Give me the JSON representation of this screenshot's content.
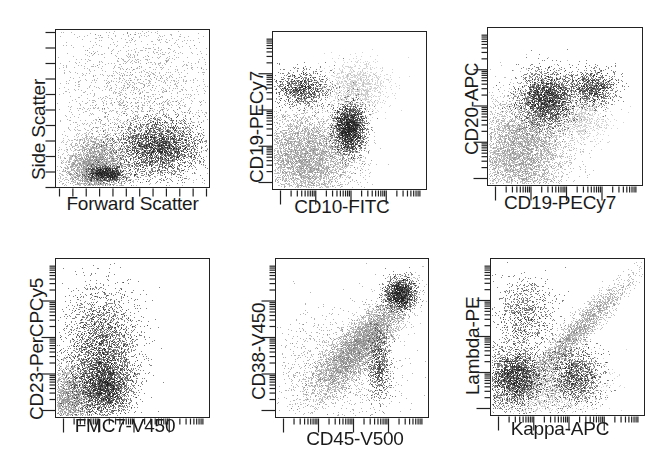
{
  "figure": {
    "colors": {
      "dark_population": "#1e1e1e",
      "gray_population": "#8a8a8a",
      "light_population": "#b8b8b8",
      "axis": "#222222"
    }
  },
  "chart_data": [
    {
      "type": "scatter",
      "title": "",
      "xlabel": "Forward Scatter",
      "ylabel": "Side Scatter",
      "scale": "linear",
      "grid": false,
      "populations": [
        {
          "name": "debris/background",
          "color": "gray",
          "cx": 0.25,
          "cy": 0.12,
          "sx": 0.1,
          "sy": 0.1,
          "n": 3500
        },
        {
          "name": "scattered events",
          "color": "scatter",
          "cx": 0.55,
          "cy": 0.55,
          "sx": 0.28,
          "sy": 0.3,
          "n": 2600
        },
        {
          "name": "lymphocytes small",
          "color": "dark",
          "cx": 0.33,
          "cy": 0.08,
          "sx": 0.06,
          "sy": 0.025,
          "n": 900
        },
        {
          "name": "lymphocytes large",
          "color": "dark",
          "cx": 0.68,
          "cy": 0.25,
          "sx": 0.14,
          "sy": 0.09,
          "n": 3200
        }
      ]
    },
    {
      "type": "scatter",
      "title": "",
      "xlabel": "CD10-FITC",
      "ylabel": "CD19-PECy7",
      "scale": "log",
      "grid": false,
      "populations": [
        {
          "name": "CD19+ CD10-",
          "color": "dark",
          "cx": 0.18,
          "cy": 0.64,
          "sx": 0.09,
          "sy": 0.06,
          "n": 1100
        },
        {
          "name": "CD10+ CD19+ cluster",
          "color": "dark",
          "cx": 0.5,
          "cy": 0.38,
          "sx": 0.05,
          "sy": 0.08,
          "n": 2400
        },
        {
          "name": "light diagonal",
          "color": "light",
          "cx": 0.55,
          "cy": 0.65,
          "sx": 0.1,
          "sy": 0.08,
          "n": 1200
        },
        {
          "name": "negative gray",
          "color": "gray",
          "cx": 0.22,
          "cy": 0.2,
          "sx": 0.16,
          "sy": 0.14,
          "n": 5000
        }
      ]
    },
    {
      "type": "scatter",
      "title": "",
      "xlabel": "CD19-PECy7",
      "ylabel": "CD20-APC",
      "scale": "log",
      "grid": false,
      "populations": [
        {
          "name": "CD19+ CD20+ main",
          "color": "dark",
          "cx": 0.38,
          "cy": 0.55,
          "sx": 0.09,
          "sy": 0.09,
          "n": 2600
        },
        {
          "name": "CD19 bright",
          "color": "dark",
          "cx": 0.68,
          "cy": 0.62,
          "sx": 0.08,
          "sy": 0.06,
          "n": 1100
        },
        {
          "name": "light tail",
          "color": "light",
          "cx": 0.6,
          "cy": 0.42,
          "sx": 0.1,
          "sy": 0.08,
          "n": 800
        },
        {
          "name": "negative gray",
          "color": "gray",
          "cx": 0.22,
          "cy": 0.22,
          "sx": 0.15,
          "sy": 0.17,
          "n": 5200
        }
      ]
    },
    {
      "type": "scatter",
      "title": "",
      "xlabel": "FMC7-V450",
      "ylabel": "CD23-PerCPCy5",
      "scale": "log",
      "grid": false,
      "populations": [
        {
          "name": "FMC7 dim cloud",
          "color": "dark",
          "cx": 0.3,
          "cy": 0.35,
          "sx": 0.12,
          "sy": 0.22,
          "n": 4200
        },
        {
          "name": "dense low",
          "color": "dark",
          "cx": 0.32,
          "cy": 0.18,
          "sx": 0.08,
          "sy": 0.08,
          "n": 1600
        },
        {
          "name": "negative gray",
          "color": "gray",
          "cx": 0.08,
          "cy": 0.12,
          "sx": 0.08,
          "sy": 0.1,
          "n": 2200
        }
      ]
    },
    {
      "type": "scatter",
      "title": "",
      "xlabel": "CD45-V500",
      "ylabel": "CD38-V450",
      "scale": "log",
      "grid": false,
      "populations": [
        {
          "name": "diagonal gray",
          "color": "gray",
          "cx": 0.55,
          "cy": 0.45,
          "sx": 0.16,
          "sy": 0.16,
          "n": 5000,
          "corr": 0.85
        },
        {
          "name": "CD45 bright CD38 bright",
          "color": "dark",
          "cx": 0.82,
          "cy": 0.78,
          "sx": 0.05,
          "sy": 0.05,
          "n": 1500
        },
        {
          "name": "CD38 dim vertical",
          "color": "dark",
          "cx": 0.68,
          "cy": 0.33,
          "sx": 0.035,
          "sy": 0.12,
          "n": 700
        },
        {
          "name": "sparse scatter",
          "color": "scatter",
          "cx": 0.4,
          "cy": 0.3,
          "sx": 0.22,
          "sy": 0.2,
          "n": 1200
        }
      ]
    },
    {
      "type": "scatter",
      "title": "",
      "xlabel": "Kappa-APC",
      "ylabel": "Lambda-PE",
      "scale": "log",
      "grid": false,
      "populations": [
        {
          "name": "lambda+",
          "color": "dark",
          "cx": 0.22,
          "cy": 0.65,
          "sx": 0.1,
          "sy": 0.12,
          "n": 900
        },
        {
          "name": "double negative",
          "color": "dark",
          "cx": 0.15,
          "cy": 0.24,
          "sx": 0.09,
          "sy": 0.1,
          "n": 2600
        },
        {
          "name": "kappa+",
          "color": "dark",
          "cx": 0.55,
          "cy": 0.25,
          "sx": 0.09,
          "sy": 0.09,
          "n": 1400
        },
        {
          "name": "diagonal nonspecific",
          "color": "gray",
          "cx": 0.55,
          "cy": 0.52,
          "sx": 0.18,
          "sy": 0.18,
          "n": 2200,
          "corr": 0.95
        },
        {
          "name": "background gray",
          "color": "light",
          "cx": 0.35,
          "cy": 0.18,
          "sx": 0.18,
          "sy": 0.1,
          "n": 2000
        }
      ]
    }
  ],
  "panels": [
    {
      "xlabel": "Forward Scatter",
      "ylabel": "Side Scatter"
    },
    {
      "xlabel": "CD10-FITC",
      "ylabel": "CD19-PECy7"
    },
    {
      "xlabel": "CD19-PECy7",
      "ylabel": "CD20-APC"
    },
    {
      "xlabel": "FMC7-V450",
      "ylabel": "CD23-PerCPCy5"
    },
    {
      "xlabel": "CD45-V500",
      "ylabel": "CD38-V450"
    },
    {
      "xlabel": "Kappa-APC",
      "ylabel": "Lambda-PE"
    }
  ]
}
